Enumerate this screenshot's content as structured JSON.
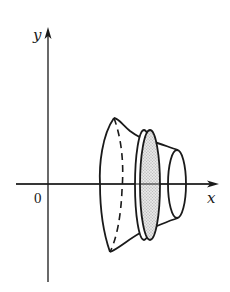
{
  "diagram": {
    "type": "solid-of-revolution",
    "axes": {
      "x_label": "x",
      "y_label": "y",
      "origin_label": "0"
    },
    "elements": [
      "left outer boundary curve (flared end)",
      "dashed hidden ellipse near left end",
      "shaded disk slice with thickness",
      "right end ellipse"
    ],
    "colors": {
      "stroke": "#1a1a1a",
      "disk_fill": "#d9d9d9",
      "background": "#ffffff"
    }
  }
}
